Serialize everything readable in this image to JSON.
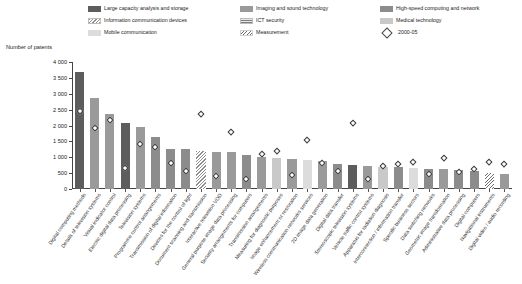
{
  "chart_data": {
    "type": "bar",
    "title": "",
    "ylabel": "Number of patents",
    "xlabel": "",
    "ylim": [
      0,
      4000
    ],
    "yticks": [
      0,
      500,
      1000,
      1500,
      2000,
      2500,
      3000,
      3500,
      4000
    ],
    "ytick_labels": [
      "0",
      "500",
      "1 000",
      "1 500",
      "2 000",
      "2 500",
      "3 000",
      "3 500",
      "4 000"
    ],
    "grid": false,
    "legend_position": "top",
    "categories": [
      "Digital computing methods",
      "Details of television systems",
      "Visual indicator control",
      "Electric digital data processing",
      "Television systems",
      "Programme control arrangements",
      "Transmission of digital information",
      "Devices for the control of light",
      "Document scanning and transmission",
      "Interactive television VOD",
      "General purpose image data processing",
      "Security arrangements for computers",
      "Transmission arrangements",
      "Measuring for diagnostic purposes",
      "Image enhancement or restoration",
      "Wireless communication networks services",
      "2D image data generation",
      "Digital data transfer",
      "Stereoscopic television systems",
      "Vehicle traffic control systems",
      "Apparatus for radiation diagnosis",
      "Interconnection / information transfer",
      "Specific business sectors",
      "Data switching networks",
      "Geometric image transformation",
      "Administrative data processing",
      "Digital computers",
      "Navigational instruments",
      "Digital video / audio recording"
    ],
    "series": [
      {
        "name": "Total patents (bar height)",
        "values": [
          3700,
          2860,
          2350,
          2070,
          1960,
          1640,
          1270,
          1270,
          1190,
          1180,
          1160,
          1080,
          1010,
          980,
          960,
          900,
          880,
          790,
          760,
          740,
          700,
          680,
          660,
          640,
          620,
          600,
          580,
          520,
          470
        ]
      },
      {
        "name": "2000-05",
        "values": [
          2440,
          1910,
          2150,
          660,
          1400,
          1320,
          810,
          560,
          2350,
          390,
          1790,
          300,
          1090,
          1180,
          440,
          1520,
          810,
          560,
          2060,
          300,
          720,
          790,
          830,
          450,
          960,
          530,
          610,
          840,
          770
        ]
      }
    ],
    "bar_groups": [
      "large-capacity",
      "imaging",
      "imaging",
      "large-capacity",
      "imaging",
      "high-speed",
      "high-speed",
      "high-speed",
      "info-devices",
      "imaging",
      "imaging",
      "high-speed",
      "imaging",
      "medical",
      "imaging",
      "mobile",
      "imaging",
      "high-speed",
      "large-capacity",
      "imaging",
      "medical",
      "high-speed",
      "mobile",
      "high-speed",
      "imaging",
      "high-speed",
      "high-speed",
      "measurement",
      "imaging"
    ]
  },
  "legend": {
    "items": [
      {
        "label": "Large capacity analysis and storage",
        "key": "c-large",
        "type": "swatch"
      },
      {
        "label": "Imaging and sound technology",
        "key": "c-imaging",
        "type": "swatch"
      },
      {
        "label": "High-speed computing and network",
        "key": "c-highspeed",
        "type": "swatch"
      },
      {
        "label": "Information communication devices",
        "key": "c-infodev",
        "type": "swatch"
      },
      {
        "label": "ICT security",
        "key": "c-ictsec",
        "type": "swatch"
      },
      {
        "label": "Medical technology",
        "key": "c-medical",
        "type": "swatch"
      },
      {
        "label": "Mobile communication",
        "key": "c-mobile",
        "type": "swatch"
      },
      {
        "label": "Measurement",
        "key": "c-measure",
        "type": "swatch"
      },
      {
        "label": "2000-05",
        "key": "dia",
        "type": "marker"
      }
    ]
  },
  "colors": {
    "large_capacity": "#5d5d5d",
    "imaging": "#9a9a9a",
    "high_speed": "#8c8c8c",
    "medical": "#c9c9c9",
    "mobile": "#dcdcdc",
    "axis": "#444444",
    "marker_fill": "#ffffff",
    "marker_stroke": "#3a3a3a"
  }
}
